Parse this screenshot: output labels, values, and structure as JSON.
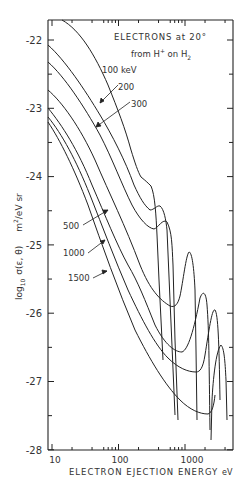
{
  "chart_data": {
    "type": "line",
    "title": "ELECTRONS at 20° from H+ on H2",
    "title_line1": "ELECTRONS at 20°",
    "title_line2_prefix": "from H",
    "title_line2_sup": "+",
    "title_line2_mid": " on H",
    "title_line2_sub": "2",
    "xlabel": "ELECTRON EJECTION ENERGY",
    "xunit": "eV",
    "ylabel": "log10 σ(ε,θ)",
    "ylabel_log": "log",
    "ylabel_sub": "10",
    "ylabel_sigma": "σ(ε, θ)",
    "yunit": "m²/eV sr",
    "yunit_m": "m",
    "yunit_sup": "2",
    "yunit_rest": "/eV  sr",
    "xscale": "log",
    "xlim": [
      10,
      5000
    ],
    "ylim": [
      -28,
      -21.7
    ],
    "xticks": [
      "10",
      "100",
      "1000"
    ],
    "yticks": [
      "-22",
      "-23",
      "-24",
      "-25",
      "-26",
      "-27",
      "-28"
    ],
    "grid": false,
    "legend_position": "inline labels with arrows",
    "series": [
      {
        "name": "100 keV",
        "label": "100 keV",
        "x": [
          14,
          20,
          40,
          70,
          100,
          150,
          200,
          260,
          300,
          330,
          380,
          400
        ],
        "y": [
          -21.7,
          -21.85,
          -22.4,
          -23.0,
          -23.55,
          -23.95,
          -24.05,
          -24.15,
          -24.55,
          -25.8,
          -26.5,
          -26.6
        ]
      },
      {
        "name": "200 keV",
        "label": "200",
        "x": [
          10,
          20,
          40,
          70,
          100,
          200,
          300,
          380,
          450,
          550,
          700,
          800
        ],
        "y": [
          -22.3,
          -22.55,
          -22.95,
          -23.5,
          -23.9,
          -24.55,
          -24.75,
          -24.7,
          -24.8,
          -26.1,
          -27.3,
          -27.4
        ]
      },
      {
        "name": "300 keV",
        "label": "300",
        "x": [
          10,
          20,
          40,
          70,
          100,
          200,
          350,
          500,
          600,
          700,
          800,
          900
        ],
        "y": [
          -22.5,
          -22.8,
          -23.25,
          -23.7,
          -24.05,
          -24.85,
          -25.35,
          -25.3,
          -25.1,
          -25.3,
          -26.5,
          -27.5
        ]
      },
      {
        "name": "500 keV",
        "label": "500",
        "x": [
          10,
          20,
          40,
          70,
          100,
          200,
          400,
          700,
          900,
          1200,
          1400,
          1600
        ],
        "y": [
          -22.85,
          -23.15,
          -23.65,
          -24.05,
          -24.45,
          -25.3,
          -26.2,
          -26.9,
          -26.85,
          -26.0,
          -25.85,
          -27.7
        ]
      },
      {
        "name": "1000 keV",
        "label": "1000",
        "x": [
          10,
          20,
          40,
          70,
          100,
          200,
          400,
          800,
          1300,
          1700,
          2000,
          2300
        ],
        "y": [
          -23.15,
          -23.5,
          -24.0,
          -24.6,
          -25.0,
          -25.9,
          -26.65,
          -27.35,
          -27.2,
          -26.2,
          -26.3,
          -27.5
        ]
      },
      {
        "name": "1500 keV",
        "label": "1500",
        "x": [
          10,
          20,
          40,
          70,
          100,
          200,
          400,
          800,
          1500,
          2500,
          3000,
          3500
        ],
        "y": [
          -23.3,
          -23.7,
          -24.2,
          -24.8,
          -25.2,
          -26.15,
          -26.95,
          -27.6,
          -27.85,
          -27.75,
          -26.4,
          -27.5
        ]
      }
    ]
  }
}
